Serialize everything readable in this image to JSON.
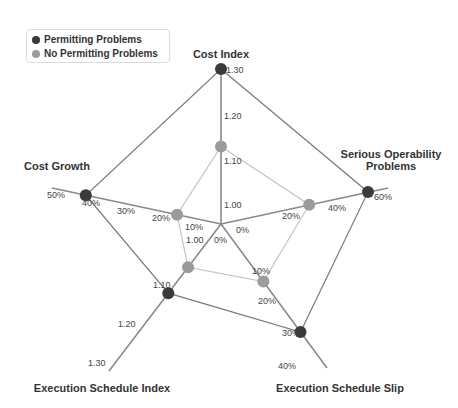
{
  "chart_data": {
    "type": "radar",
    "title": "",
    "legend": {
      "placement": "top-left",
      "entries": [
        {
          "name": "Permitting Problems",
          "color": "#3a3a3a"
        },
        {
          "name": "No Permitting Problems",
          "color": "#9b9b9b"
        }
      ]
    },
    "axes": [
      {
        "key": "cost_index",
        "title": [
          "Cost Index"
        ],
        "ticks": [
          "1.00",
          "1.10",
          "1.20",
          "1.30"
        ],
        "range": [
          0.96,
          1.3
        ]
      },
      {
        "key": "serious_operability",
        "title": [
          "Serious Operability",
          "Problems"
        ],
        "ticks": [
          "0%",
          "20%",
          "40%",
          "60%"
        ],
        "range": [
          0,
          60
        ]
      },
      {
        "key": "schedule_slip",
        "title": [
          "Execution Schedule Slip"
        ],
        "ticks": [
          "0%",
          "10%",
          "20%",
          "30%",
          "40%"
        ],
        "range": [
          0,
          40
        ]
      },
      {
        "key": "schedule_index",
        "title": [
          "Execution Schedule Index"
        ],
        "ticks": [
          "1.00",
          "1.10",
          "1.20",
          "1.30"
        ],
        "range": [
          0.96,
          1.3
        ]
      },
      {
        "key": "cost_growth",
        "title": [
          "Cost Growth"
        ],
        "ticks": [
          "10%",
          "20%",
          "30%",
          "40%",
          "50%"
        ],
        "range": [
          0,
          50
        ]
      }
    ],
    "series": [
      {
        "name": "Permitting Problems",
        "color": "#3a3a3a",
        "values": {
          "cost_index": 1.3,
          "serious_operability": 60,
          "schedule_slip": 30,
          "schedule_index": 1.12,
          "cost_growth": 40
        }
      },
      {
        "name": "No Permitting Problems",
        "color": "#9b9b9b",
        "values": {
          "cost_index": 1.13,
          "serious_operability": 36,
          "schedule_slip": 16,
          "schedule_index": 1.06,
          "cost_growth": 13
        }
      }
    ]
  }
}
